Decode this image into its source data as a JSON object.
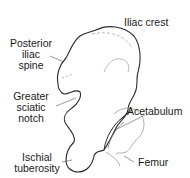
{
  "diagram": {
    "labels": {
      "iliac_crest": "Iliac crest",
      "posterior_iliac_spine": "Posterior\niliac\nspine",
      "greater_sciatic_notch": "Greater\nsciatic\nnotch",
      "acetabulum": "Acetabulum",
      "ischial_tuberosity": "Ischial\ntuberosity",
      "femur": "Femur"
    },
    "colors": {
      "outline": "#2a2a2a",
      "detail": "#9a9a9a",
      "leader": "#555555",
      "text": "#1a1a1a"
    }
  }
}
